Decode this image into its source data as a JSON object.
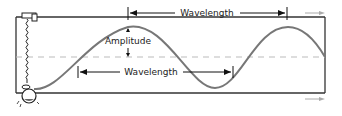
{
  "diagram": {
    "labels": {
      "wavelength_top": "Wavelength",
      "amplitude": "Amplitude",
      "wavelength_bottom": "Wavelength"
    },
    "colors": {
      "frame": "#333333",
      "wave": "#777777",
      "midline": "#bbbbbb",
      "arrow": "#111111",
      "motion_arrow": "#aaaaaa"
    },
    "parts": [
      "spring",
      "weight-bulb",
      "wave",
      "equilibrium-line",
      "frame"
    ]
  }
}
